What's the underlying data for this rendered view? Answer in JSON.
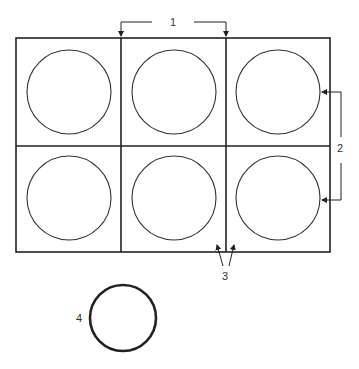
{
  "diagram": {
    "labels": {
      "top": "1",
      "right": "2",
      "bottom": "3",
      "single_circle": "4"
    },
    "grid": {
      "rows": 2,
      "columns": 3
    },
    "colors": {
      "stroke": "#222222",
      "background": "#ffffff"
    }
  }
}
